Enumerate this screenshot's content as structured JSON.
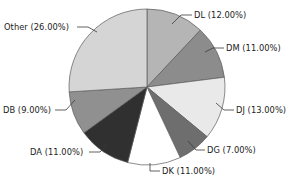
{
  "chart_data": {
    "type": "pie",
    "title": "",
    "subtitle": "",
    "xlabel": "",
    "ylabel": "",
    "grid": false,
    "legend_position": "none",
    "label_format": "NAME (PP.PP%)",
    "start_angle_deg": 0,
    "direction": "clockwise",
    "total_percent": 100.0,
    "categories": [
      "DL",
      "DM",
      "DJ",
      "DG",
      "DK",
      "DA",
      "DB",
      "Other"
    ],
    "values": [
      12.0,
      11.0,
      13.0,
      7.0,
      11.0,
      11.0,
      9.0,
      26.0
    ],
    "slices": [
      {
        "name": "DL",
        "value": 12.0,
        "percent_text": "12.00%",
        "label": "DL (12.00%)",
        "color": "#b5b5b5"
      },
      {
        "name": "DM",
        "value": 11.0,
        "percent_text": "11.00%",
        "label": "DM (11.00%)",
        "color": "#8c8c8c"
      },
      {
        "name": "DJ",
        "value": 13.0,
        "percent_text": "13.00%",
        "label": "DJ (13.00%)",
        "color": "#e9e9e9"
      },
      {
        "name": "DG",
        "value": 7.0,
        "percent_text": "7.00%",
        "label": "DG (7.00%)",
        "color": "#6e6e6e"
      },
      {
        "name": "DK",
        "value": 11.0,
        "percent_text": "11.00%",
        "label": "DK (11.00%)",
        "color": "#ffffff"
      },
      {
        "name": "DA",
        "value": 11.0,
        "percent_text": "11.00%",
        "label": "DA (11.00%)",
        "color": "#303030"
      },
      {
        "name": "DB",
        "value": 9.0,
        "percent_text": "9.00%",
        "label": "DB (9.00%)",
        "color": "#909090"
      },
      {
        "name": "Other",
        "value": 26.0,
        "percent_text": "26.00%",
        "label": "Other (26.00%)",
        "color": "#d5d5d5"
      }
    ],
    "style": {
      "background": "#ffffff",
      "slice_outline": "#5a5a5a",
      "leader_line": "#3a3a3a",
      "text_color": "#1c1c1c"
    }
  }
}
